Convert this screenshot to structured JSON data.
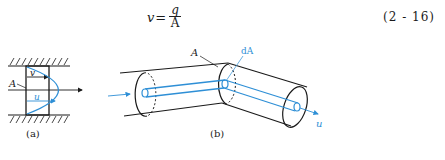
{
  "equation": {
    "lhs": "v",
    "equals": "=",
    "numerator": "q",
    "denominator": "A",
    "number": "(2 - 16)"
  },
  "figure_a": {
    "label_area": "A",
    "label_mean_velocity": "v",
    "label_point_velocity": "u",
    "caption": "(a)"
  },
  "figure_b": {
    "label_area": "A",
    "label_element_area": "dA",
    "label_velocity": "u",
    "caption": "(b)"
  },
  "colors": {
    "ink": "#1a1a1a",
    "accent_blue": "#2e8fd6"
  }
}
